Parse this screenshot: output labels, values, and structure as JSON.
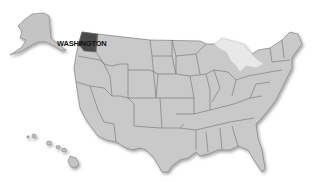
{
  "header": {
    "title_partial": ""
  },
  "map": {
    "type": "US states map",
    "highlighted_state": "WASHINGTON",
    "label": "WASHINGTON",
    "colors": {
      "land": "#c9c9c9",
      "border": "#707070",
      "highlight": "#4a4a4a",
      "background": "#ffffff"
    },
    "insets": [
      "Alaska",
      "Hawaii"
    ]
  }
}
